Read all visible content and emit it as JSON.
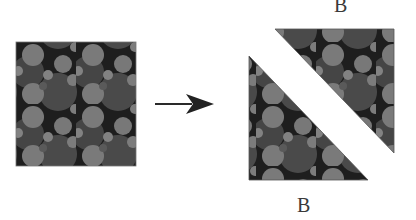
{
  "diagram": {
    "type": "transformation",
    "description_steps": [
      "source-square",
      "arrow",
      "diagonal-split-triangles"
    ],
    "source_square": {
      "x": 16,
      "y": 42,
      "width": 120,
      "height": 124
    },
    "arrow": {
      "x1": 155,
      "y1": 104,
      "x2": 214,
      "y2": 104,
      "color": "#2a2a2a"
    },
    "upper_triangle": {
      "points": "275,29 394,29 394,153",
      "label": "B"
    },
    "lower_triangle": {
      "points": "249,56 249,180 368,180",
      "label": "B"
    },
    "labels": {
      "top": "B",
      "bottom": "B"
    },
    "colors": {
      "background": "#ffffff",
      "matrix": "#1e1e1e",
      "large_particle": "#4a4a4a",
      "medium_particle": "#7a7a7a",
      "small_particle": "#828282",
      "label": "#3a3a3a"
    },
    "pattern_tile": {
      "width": 60,
      "height": 62
    }
  }
}
